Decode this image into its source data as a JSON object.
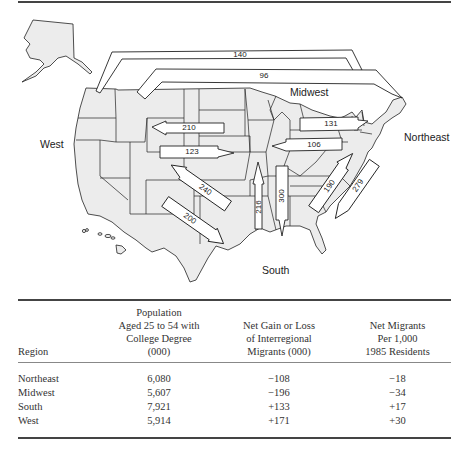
{
  "map": {
    "region_labels": {
      "west": "West",
      "midwest": "Midwest",
      "northeast": "Northeast",
      "south": "South"
    },
    "flows": [
      {
        "id": "f140",
        "value": "140",
        "from": "Northeast",
        "to": "West"
      },
      {
        "id": "f96",
        "value": "96",
        "from": "West",
        "to": "Northeast"
      },
      {
        "id": "f210",
        "value": "210",
        "from": "Midwest",
        "to": "West"
      },
      {
        "id": "f123",
        "value": "123",
        "from": "West",
        "to": "Midwest"
      },
      {
        "id": "f240",
        "value": "240",
        "from": "South",
        "to": "West"
      },
      {
        "id": "f200",
        "value": "200",
        "from": "West",
        "to": "South"
      },
      {
        "id": "f216",
        "value": "216",
        "from": "South",
        "to": "Midwest"
      },
      {
        "id": "f300",
        "value": "300",
        "from": "Midwest",
        "to": "South"
      },
      {
        "id": "f131",
        "value": "131",
        "from": "Midwest",
        "to": "Northeast"
      },
      {
        "id": "f106",
        "value": "106",
        "from": "Northeast",
        "to": "Midwest"
      },
      {
        "id": "f190",
        "value": "190",
        "from": "South",
        "to": "Northeast"
      },
      {
        "id": "f279",
        "value": "279",
        "from": "Northeast",
        "to": "South"
      }
    ]
  },
  "table": {
    "headers": [
      [
        "Region"
      ],
      [
        "Population",
        "Aged 25 to 54 with",
        "College Degree",
        "(000)"
      ],
      [
        "Net Gain or Loss",
        "of Interregional",
        "Migrants (000)"
      ],
      [
        "Net Migrants",
        "Per 1,000",
        "1985 Residents"
      ]
    ],
    "rows": [
      {
        "region": "Northeast",
        "population": "6,080",
        "net_gain": "−108",
        "per_1000": "−18"
      },
      {
        "region": "Midwest",
        "population": "5,607",
        "net_gain": "−196",
        "per_1000": "−34"
      },
      {
        "region": "South",
        "population": "7,921",
        "net_gain": "+133",
        "per_1000": "+17"
      },
      {
        "region": "West",
        "population": "5,914",
        "net_gain": "+171",
        "per_1000": "+30"
      }
    ]
  }
}
